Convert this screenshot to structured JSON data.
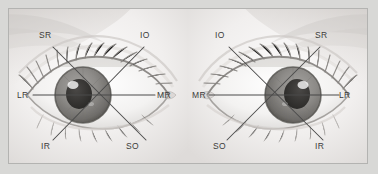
{
  "figure": {
    "background_color": "#d8d8d6",
    "plate_color": "#fdfdfd",
    "border_color": "#b3b3b1",
    "line_color": "#4a4a4a",
    "label_color": "#3b3b3b"
  },
  "panels": [
    {
      "id": "left-eye",
      "name": "left-eye-panel",
      "center": {
        "x": 92,
        "y": 86
      },
      "labels": [
        {
          "id": "sr",
          "text": "SR",
          "x": 30,
          "y": 28,
          "position": "top-left"
        },
        {
          "id": "io",
          "text": "IO",
          "x": 131,
          "y": 28,
          "position": "top-right"
        },
        {
          "id": "lr",
          "text": "LR",
          "x": 8,
          "y": 82,
          "position": "left"
        },
        {
          "id": "mr",
          "text": "MR",
          "x": 148,
          "y": 82,
          "position": "right"
        },
        {
          "id": "ir",
          "text": "IR",
          "x": 32,
          "y": 134,
          "position": "bottom-left"
        },
        {
          "id": "so",
          "text": "SO",
          "x": 117,
          "y": 134,
          "position": "bottom-right"
        }
      ]
    },
    {
      "id": "right-eye",
      "name": "right-eye-panel",
      "center": {
        "x": 88,
        "y": 86
      },
      "labels": [
        {
          "id": "io",
          "text": "IO",
          "x": 28,
          "y": 28,
          "position": "top-left"
        },
        {
          "id": "sr",
          "text": "SR",
          "x": 128,
          "y": 28,
          "position": "top-right"
        },
        {
          "id": "mr",
          "text": "MR",
          "x": 5,
          "y": 82,
          "position": "left"
        },
        {
          "id": "lr",
          "text": "LR",
          "x": 152,
          "y": 82,
          "position": "right"
        },
        {
          "id": "so",
          "text": "SO",
          "x": 26,
          "y": 134,
          "position": "bottom-left"
        },
        {
          "id": "ir",
          "text": "IR",
          "x": 128,
          "y": 134,
          "position": "bottom-right"
        }
      ]
    }
  ],
  "muscle_key": {
    "SR": "superior rectus",
    "IR": "inferior rectus",
    "MR": "medial rectus",
    "LR": "lateral rectus",
    "SO": "superior oblique",
    "IO": "inferior oblique"
  }
}
